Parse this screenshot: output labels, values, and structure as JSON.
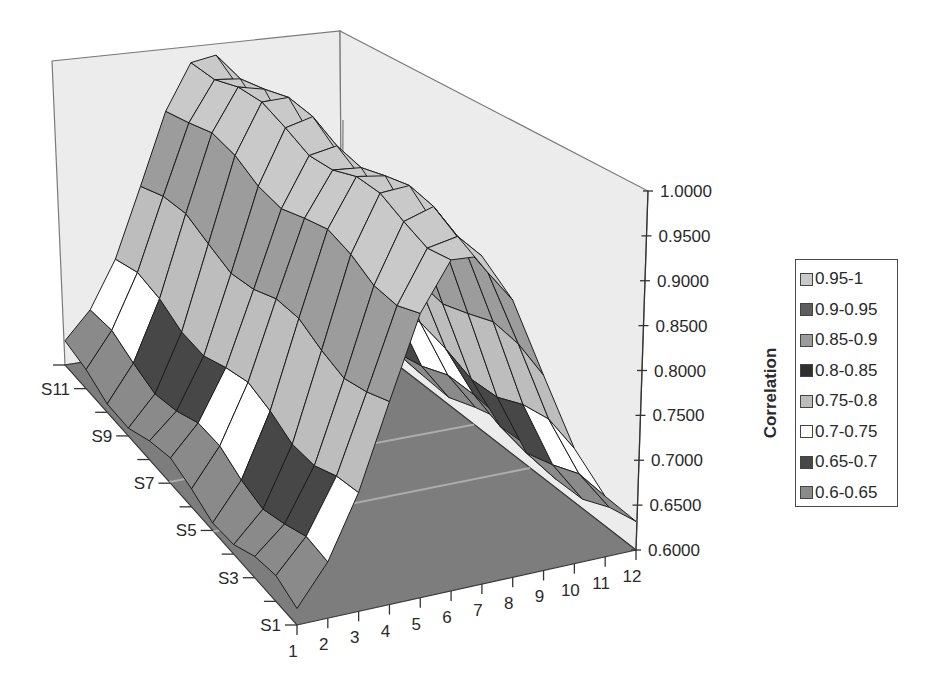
{
  "chart_data": {
    "type": "surface3d",
    "title": "",
    "xlabel": "",
    "ylabel": "",
    "zlabel": "Correlation",
    "x_categories": [
      "1",
      "2",
      "3",
      "4",
      "5",
      "6",
      "7",
      "8",
      "9",
      "10",
      "11",
      "12"
    ],
    "series_labels_shown": [
      "S1",
      "S3",
      "S5",
      "S7",
      "S9",
      "S11"
    ],
    "series": [
      "S1",
      "S2",
      "S3",
      "S4",
      "S5",
      "S6",
      "S7",
      "S8",
      "S9",
      "S10",
      "S11",
      "S12"
    ],
    "zlim": [
      0.6,
      1.0
    ],
    "z_ticks": [
      "1.0000",
      "0.9500",
      "0.9000",
      "0.8500",
      "0.8000",
      "0.7500",
      "0.7000",
      "0.6500",
      "0.6000"
    ],
    "grid": false,
    "legend_position": "right",
    "legend": [
      {
        "label": "0.95-1",
        "color": "#c9c9c9"
      },
      {
        "label": "0.9-0.95",
        "color": "#5e5e5e"
      },
      {
        "label": "0.85-0.9",
        "color": "#9c9c9c"
      },
      {
        "label": "0.8-0.85",
        "color": "#2f2f2f"
      },
      {
        "label": "0.75-0.8",
        "color": "#bdbdbd"
      },
      {
        "label": "0.7-0.75",
        "color": "#ffffff"
      },
      {
        "label": "0.65-0.7",
        "color": "#474747"
      },
      {
        "label": "0.6-0.65",
        "color": "#8a8a8a"
      }
    ],
    "values_description": "Gaussian-like ridge along x: approx 0.62 at x=1 and x=12, peaking near 1.0 around x=6-7, roughly constant across S1-S12",
    "values_by_x": [
      0.62,
      0.66,
      0.73,
      0.83,
      0.93,
      0.99,
      0.99,
      0.93,
      0.83,
      0.73,
      0.66,
      0.62
    ]
  },
  "colors": {
    "wall": "#ececec",
    "floor": "#7d7d7d",
    "wall_edge": "#7a7a7a",
    "mesh_line": "#1e1e1e"
  }
}
